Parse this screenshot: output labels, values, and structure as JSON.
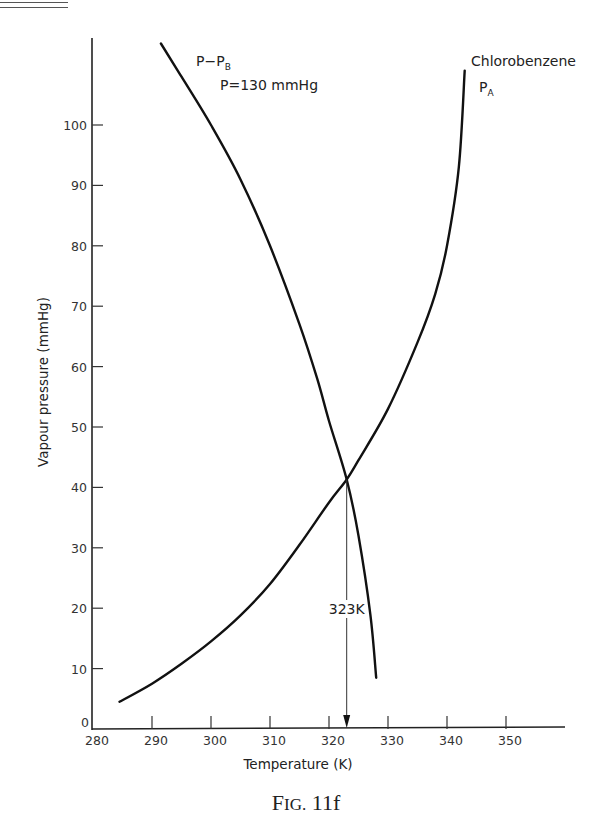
{
  "figure": {
    "caption": "FIG. 11f"
  },
  "chart_data": {
    "type": "line",
    "title": "",
    "xlabel": "Temperature (K)",
    "ylabel": "Vapour pressure (mmHg)",
    "xlim": [
      280,
      360
    ],
    "ylim": [
      0,
      110
    ],
    "x_ticks": [
      280,
      290,
      300,
      310,
      320,
      330,
      340,
      350
    ],
    "y_ticks": [
      0,
      10,
      20,
      30,
      40,
      50,
      60,
      70,
      80,
      90,
      100
    ],
    "grid": false,
    "legend": "none (inline curve labels)",
    "series": [
      {
        "name": "Chlorobenzene P_A",
        "label_line1": "Chlorobenzene",
        "label_line2": "P",
        "label_sub": "A",
        "x": [
          284.5,
          290,
          295,
          300,
          305,
          310,
          315,
          320,
          323,
          325,
          330,
          335,
          338,
          340,
          342,
          343
        ],
        "y": [
          4.5,
          7.5,
          10.8,
          14.5,
          18.8,
          24,
          30.5,
          37.5,
          41.3,
          44.5,
          53,
          64,
          72,
          80,
          93,
          109
        ]
      },
      {
        "name": "P - P_B (P = 130 mmHg)",
        "label_line1": "P−P",
        "label_sub": "B",
        "label_line2": "P=130 mmHg",
        "x": [
          291.5,
          295,
          300,
          305,
          310,
          315,
          318,
          320,
          323,
          325,
          327,
          328
        ],
        "y": [
          113.5,
          108,
          100,
          91,
          80,
          67,
          58,
          51,
          41.3,
          32,
          19,
          8.5
        ]
      }
    ],
    "annotations": [
      {
        "text": "323K",
        "type": "vertical-arrow",
        "x": 323,
        "from_y": 41.3,
        "to_y": 0
      }
    ],
    "intersection": {
      "x": 323,
      "y": 41.3
    }
  },
  "axes": {
    "x_title": "Temperature (K)",
    "y_title": "Vapour pressure (mmHg)",
    "x_tick_labels": [
      "280",
      "290",
      "300",
      "310",
      "320",
      "330",
      "340",
      "350"
    ],
    "y_tick_labels": [
      "0",
      "10",
      "20",
      "30",
      "40",
      "50",
      "60",
      "70",
      "80",
      "90",
      "100"
    ]
  },
  "labels": {
    "pb_curve_main": "P−P",
    "pb_curve_sub": "B",
    "pb_curve_pressure": "P=130 mmHg",
    "pa_curve_name": "Chlorobenzene",
    "pa_curve_main": "P",
    "pa_curve_sub": "A",
    "arrow_label": "323K"
  }
}
